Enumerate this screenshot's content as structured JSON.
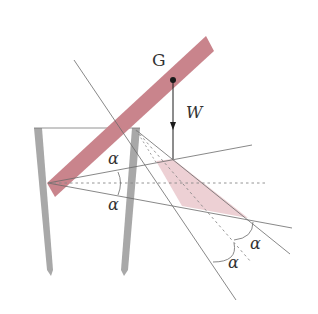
{
  "diagram": {
    "labels": {
      "center_of_gravity": "G",
      "weight": "W",
      "angle_a_upper": "α",
      "angle_a_lower": "α",
      "angle_b_right": "α",
      "angle_b_left": "α"
    },
    "colors": {
      "rod": "#c9848c",
      "region_fill": "#edd0d4",
      "wall": "#a8a8a8",
      "line": "#6a6a6a",
      "arrow": "#1a1a1a"
    }
  }
}
